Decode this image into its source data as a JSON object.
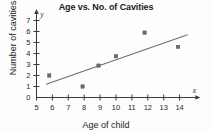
{
  "chart_data": {
    "type": "scatter",
    "title": "Age vs. No. of Cavities",
    "xlabel": "Age of child",
    "ylabel": "Number of cavities",
    "x_axis_letter": "x",
    "y_axis_letter": "y",
    "xlim": [
      5,
      14.8
    ],
    "ylim": [
      0,
      7.4
    ],
    "xticks": [
      5,
      6,
      7,
      8,
      9,
      10,
      11,
      12,
      13,
      14
    ],
    "yticks": [
      0,
      1,
      2,
      3,
      4,
      5,
      6,
      7
    ],
    "xtick_labels": [
      "5",
      "6",
      "7",
      "8",
      "9",
      "10",
      "11",
      "12",
      "13",
      "14"
    ],
    "ytick_labels": [
      "0",
      "1",
      "2",
      "3",
      "4",
      "5",
      "6",
      "7"
    ],
    "grid": false,
    "legend": "none",
    "points": [
      {
        "x": 5.8,
        "y": 2.0
      },
      {
        "x": 7.9,
        "y": 1.0
      },
      {
        "x": 8.9,
        "y": 2.9
      },
      {
        "x": 10.0,
        "y": 3.75
      },
      {
        "x": 11.8,
        "y": 5.9
      },
      {
        "x": 13.9,
        "y": 4.6
      }
    ],
    "trend_line": {
      "name": "line of best fit",
      "x_start": 5.6,
      "y_start": 1.2,
      "x_end": 14.5,
      "y_end": 5.7
    },
    "colors": {
      "axis": "#3a3a3a",
      "point": "#6a6a6a",
      "trend": "#6f6f6f",
      "text": "#1b1b1b",
      "background": "#fdfdfd"
    }
  }
}
